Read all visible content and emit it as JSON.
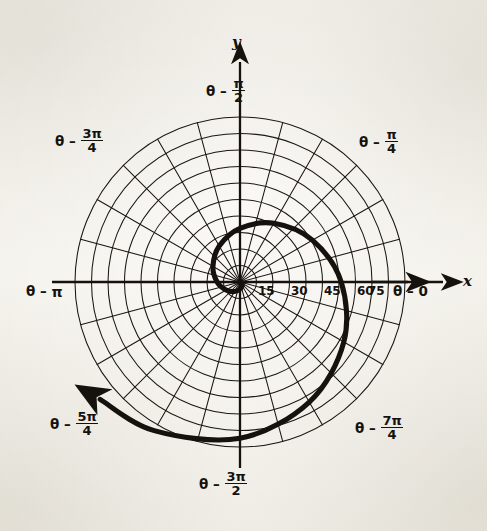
{
  "figure": {
    "kind": "polar-plot",
    "background_color": "#f2f0ea",
    "ink_color": "#15120e",
    "center_px": [
      240,
      282
    ],
    "outer_radius_px": 165
  },
  "axes": {
    "x_label": "x",
    "y_label": "y",
    "x_arrow_name": "x-axis-arrow",
    "y_arrow_name": "y-axis-arrow"
  },
  "angle_labels": [
    {
      "id": "theta-0",
      "lead": "θ –",
      "value": "0",
      "frac": false,
      "num": "",
      "den": ""
    },
    {
      "id": "theta-pi-4",
      "lead": "θ –",
      "value": "",
      "frac": true,
      "num": "π",
      "den": "4"
    },
    {
      "id": "theta-pi-2",
      "lead": "θ –",
      "value": "",
      "frac": true,
      "num": "π",
      "den": "2"
    },
    {
      "id": "theta-3pi-4",
      "lead": "θ –",
      "value": "",
      "frac": true,
      "num": "3π",
      "den": "4"
    },
    {
      "id": "theta-pi",
      "lead": "θ –",
      "value": "π",
      "frac": false,
      "num": "",
      "den": ""
    },
    {
      "id": "theta-5pi-4",
      "lead": "θ –",
      "value": "",
      "frac": true,
      "num": "5π",
      "den": "4"
    },
    {
      "id": "theta-3pi-2",
      "lead": "θ –",
      "value": "",
      "frac": true,
      "num": "3π",
      "den": "2"
    },
    {
      "id": "theta-7pi-4",
      "lead": "θ –",
      "value": "",
      "frac": true,
      "num": "7π",
      "den": "4"
    }
  ],
  "chart_data": {
    "type": "line",
    "coordinate_system": "polar",
    "title": "",
    "xlabel": "x",
    "ylabel": "y",
    "grid": true,
    "legend": "none",
    "radial_axis": {
      "tick_labels": [
        "15",
        "30",
        "45",
        "60",
        "75"
      ],
      "tick_values": [
        15,
        30,
        45,
        60,
        75
      ],
      "rlim": [
        0,
        75
      ],
      "label_angle_deg": 0,
      "circles_drawn": 10,
      "circle_step": 7.5
    },
    "angular_axis": {
      "tick_labels": [
        "θ – 0",
        "θ – π/4",
        "θ – π/2",
        "θ – 3π/4",
        "θ – π",
        "θ – 5π/4",
        "θ – 3π/2",
        "θ – 7π/4"
      ],
      "tick_values_deg": [
        0,
        45,
        90,
        135,
        180,
        225,
        270,
        315
      ],
      "spoke_count": 24,
      "spoke_step_deg": 15
    },
    "series": [
      {
        "name": "spiral",
        "description": "Exponential (logarithmic) spiral r = e^(kθ) drawn from the origin, sweeping clockwise through negative angles and terminating with an arrowhead in the first quadrant.",
        "curve_kind": "logarithmic-spiral",
        "arrow_at_end": true,
        "theta_deg": [
          -10,
          -30,
          -60,
          -90,
          -120,
          -150,
          -180,
          -210,
          -240,
          -270,
          -300,
          -330,
          -360,
          -390,
          -420,
          -450,
          -480,
          -500
        ],
        "r": [
          0.6,
          1.0,
          1.9,
          3.2,
          5.0,
          7.3,
          10.4,
          14.2,
          18.9,
          24.4,
          30.8,
          38.0,
          46.0,
          54.5,
          63.0,
          71.0,
          78.0,
          83.0
        ]
      }
    ]
  }
}
